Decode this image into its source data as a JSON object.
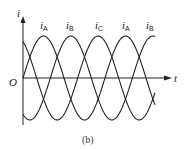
{
  "figure": {
    "caption": "(b)",
    "y_axis_label": "i",
    "x_axis_label": "t",
    "origin_label": "O"
  },
  "curve_labels": [
    {
      "main": "i",
      "sub": "A",
      "x": 40
    },
    {
      "main": "i",
      "sub": "B",
      "x": 66
    },
    {
      "main": "i",
      "sub": "C",
      "x": 95
    },
    {
      "main": "i",
      "sub": "A",
      "x": 122
    },
    {
      "main": "i",
      "sub": "B",
      "x": 146
    }
  ],
  "chart_data": {
    "type": "line",
    "title": "",
    "caption": "(b)",
    "xlabel": "t",
    "ylabel": "i",
    "series": [
      {
        "name": "iA",
        "phase_deg": 0,
        "amplitude": 1
      },
      {
        "name": "iB",
        "phase_deg": -120,
        "amplitude": 1
      },
      {
        "name": "iC",
        "phase_deg": 120,
        "amplitude": 1
      }
    ],
    "peak_order": [
      "iA",
      "iB",
      "iC",
      "iA",
      "iB"
    ],
    "cycles_shown": 1.6,
    "grid": false,
    "legend": "inline labels above peaks"
  },
  "colors": {
    "line": "#222222",
    "background": "#ffffff"
  }
}
